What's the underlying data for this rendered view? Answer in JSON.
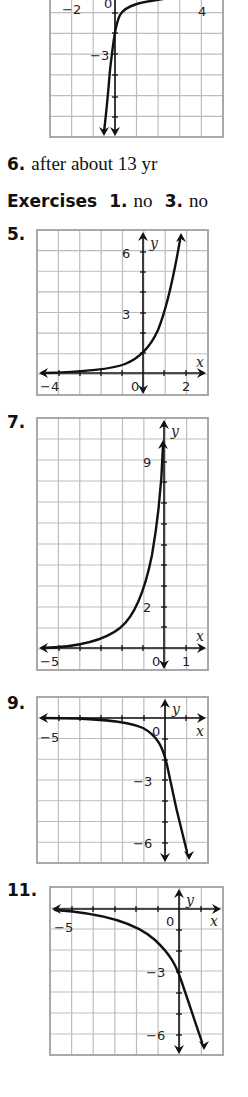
{
  "answers": {
    "item6": {
      "number": "6.",
      "text": "after about 13 yr"
    },
    "exercises": {
      "title": "Exercises",
      "items": [
        {
          "number": "1.",
          "text": "no"
        },
        {
          "number": "3.",
          "text": "no"
        }
      ]
    }
  },
  "colors": {
    "grid": "#bdbdbd",
    "border": "#a9a9a9",
    "ink": "#111111"
  },
  "chart_data": [
    {
      "id": "graph-top",
      "type": "line",
      "title": "",
      "box": {
        "left": 50,
        "top": -8,
        "width": 173,
        "height": 145
      },
      "cols": 8,
      "rows": 7,
      "axes": {
        "yaxis_x": 115,
        "xaxis_y": null
      },
      "tick_labels": [
        {
          "text": "−2",
          "x": 62,
          "y": 14
        },
        {
          "text": "0",
          "x": 104,
          "y": 8
        },
        {
          "text": "4",
          "x": 198,
          "y": 16
        },
        {
          "text": "−3",
          "x": 90,
          "y": 60
        }
      ],
      "y_ticks": [
        13,
        33,
        54,
        75,
        97,
        117
      ],
      "yaxis_arrow": "down",
      "curve": "M 170 -2 C 140 2, 126 5, 120 15 C 115 25, 113 45, 110 70 C 108 95, 106 115, 104 132",
      "curve_arrow_end": {
        "x": 104,
        "y": 136,
        "dir": "down"
      },
      "xlabel": "",
      "ylabel": ""
    },
    {
      "id": "graph-5",
      "label": "5.",
      "label_pos": {
        "x": 7,
        "y": 228
      },
      "type": "line",
      "function": "y = 3^x",
      "box": {
        "left": 37,
        "top": 230,
        "width": 171,
        "height": 165
      },
      "cols": 8,
      "rows": 8,
      "axes": {
        "yaxis_x": 143,
        "xaxis_y": 373
      },
      "x_range": [
        -5,
        3
      ],
      "y_range": [
        -1,
        7
      ],
      "x_ticks_px": [
        59,
        80,
        101,
        122,
        164,
        186
      ],
      "y_ticks_px": [
        252,
        272,
        292,
        313,
        333,
        353
      ],
      "tick_labels": [
        {
          "text": "6",
          "x": 122,
          "y": 258
        },
        {
          "text": "3",
          "x": 122,
          "y": 319
        },
        {
          "text": "−4",
          "x": 40,
          "y": 391
        },
        {
          "text": "0",
          "x": 131,
          "y": 391
        },
        {
          "text": "2",
          "x": 182,
          "y": 391
        }
      ],
      "axis_labels": [
        {
          "text": "y",
          "x": 150,
          "y": 248
        },
        {
          "text": "x",
          "x": 196,
          "y": 367
        }
      ],
      "yaxis_arrows": [
        "up",
        "down"
      ],
      "xaxis_arrows": [
        "left",
        "right"
      ],
      "curve": "M 42 373 C 80 372, 110 370, 125 364 C 140 358, 150 348, 158 330 C 166 310, 174 275, 180 240",
      "curve_arrow_end": {
        "x": 181,
        "y": 233,
        "dir": "up"
      },
      "xlabel": "x",
      "ylabel": "y"
    },
    {
      "id": "graph-7",
      "label": "7.",
      "label_pos": {
        "x": 7,
        "y": 416
      },
      "type": "line",
      "function": "y = 3^(x+2)",
      "box": {
        "left": 37,
        "top": 418,
        "width": 171,
        "height": 252
      },
      "cols": 8,
      "rows": 12,
      "axes": {
        "yaxis_x": 164,
        "xaxis_y": 648
      },
      "x_range": [
        -6,
        2
      ],
      "y_range": [
        -1,
        11
      ],
      "x_ticks_px": [
        59,
        80,
        101,
        122,
        143,
        186
      ],
      "y_ticks_px": [
        462,
        482,
        503,
        524,
        545,
        565,
        586,
        607,
        627
      ],
      "tick_labels": [
        {
          "text": "9",
          "x": 143,
          "y": 467
        },
        {
          "text": "2",
          "x": 143,
          "y": 612
        },
        {
          "text": "−5",
          "x": 40,
          "y": 666
        },
        {
          "text": "0",
          "x": 152,
          "y": 666
        },
        {
          "text": "1",
          "x": 182,
          "y": 666
        }
      ],
      "axis_labels": [
        {
          "text": "y",
          "x": 171,
          "y": 436
        },
        {
          "text": "x",
          "x": 196,
          "y": 641
        }
      ],
      "yaxis_arrows": [
        "up",
        "down"
      ],
      "xaxis_arrows": [
        "left",
        "right"
      ],
      "curve": "M 42 648 C 80 647, 105 640, 120 628 C 135 616, 145 590, 152 555 C 158 520, 162 480, 163 445",
      "curve_arrow_end": {
        "x": 163,
        "y": 440,
        "dir": "up"
      },
      "xlabel": "x",
      "ylabel": "y"
    },
    {
      "id": "graph-9",
      "label": "9.",
      "label_pos": {
        "x": 7,
        "y": 697
      },
      "type": "line",
      "function": "y = -2(3^x)",
      "box": {
        "left": 37,
        "top": 697,
        "width": 171,
        "height": 166
      },
      "cols": 8,
      "rows": 8,
      "axes": {
        "yaxis_x": 165,
        "xaxis_y": 718
      },
      "x_range": [
        -6,
        2
      ],
      "y_range": [
        -7,
        1
      ],
      "x_ticks_px": [
        59,
        80,
        101,
        122,
        144,
        186
      ],
      "y_ticks_px": [
        739,
        760,
        780,
        801,
        822,
        843
      ],
      "tick_labels": [
        {
          "text": "−5",
          "x": 40,
          "y": 742
        },
        {
          "text": "0",
          "x": 152,
          "y": 736
        },
        {
          "text": "−3",
          "x": 133,
          "y": 786
        },
        {
          "text": "−6",
          "x": 133,
          "y": 848
        }
      ],
      "axis_labels": [
        {
          "text": "y",
          "x": 172,
          "y": 714
        },
        {
          "text": "x",
          "x": 196,
          "y": 736
        }
      ],
      "yaxis_arrows": [
        "up",
        "down"
      ],
      "xaxis_arrows": [
        "left",
        "right"
      ],
      "curve": "M 42 718 C 90 718, 125 720, 143 728 C 158 736, 163 748, 167 765 C 172 790, 180 825, 187 852",
      "curve_arrow_end": {
        "x": 189,
        "y": 860,
        "dir": "down"
      },
      "xlabel": "x",
      "ylabel": "y"
    },
    {
      "id": "graph-11",
      "label": "11.",
      "label_pos": {
        "x": 7,
        "y": 885
      },
      "type": "line",
      "function": "y = -3(2^x)",
      "box": {
        "left": 50,
        "top": 887,
        "width": 173,
        "height": 168
      },
      "cols": 8,
      "rows": 8,
      "axes": {
        "yaxis_x": 179,
        "xaxis_y": 909
      },
      "x_range": [
        -6,
        2
      ],
      "y_range": [
        -7,
        1
      ],
      "x_ticks_px": [
        72,
        93,
        115,
        136,
        158,
        201
      ],
      "y_ticks_px": [
        930,
        951,
        972,
        993,
        1014,
        1035
      ],
      "tick_labels": [
        {
          "text": "−5",
          "x": 54,
          "y": 932
        },
        {
          "text": "0",
          "x": 166,
          "y": 926
        },
        {
          "text": "−3",
          "x": 146,
          "y": 977
        },
        {
          "text": "−6",
          "x": 146,
          "y": 1040
        }
      ],
      "axis_labels": [
        {
          "text": "y",
          "x": 186,
          "y": 905
        },
        {
          "text": "x",
          "x": 210,
          "y": 926
        }
      ],
      "yaxis_arrows": [
        "up",
        "down"
      ],
      "xaxis_arrows": [
        "left",
        "right"
      ],
      "curve": "M 55 910 C 100 913, 135 922, 155 940 C 170 954, 176 965, 181 980 C 188 1000, 196 1025, 202 1042",
      "curve_arrow_end": {
        "x": 204,
        "y": 1050,
        "dir": "down"
      },
      "xlabel": "x",
      "ylabel": "y"
    }
  ]
}
